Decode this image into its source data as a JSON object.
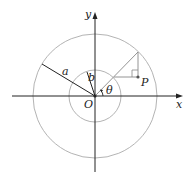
{
  "diagram": {
    "title": "",
    "labels": {
      "x_axis": "x",
      "y_axis": "y",
      "origin": "O",
      "outer_radius": "a",
      "inner_radius": "b",
      "angle": "θ",
      "point": "P"
    },
    "elements": {
      "outer_circle": {
        "center": [
          95,
          96
        ],
        "radius": 62,
        "color": "#aaaaaa"
      },
      "inner_circle": {
        "center": [
          95,
          96
        ],
        "radius": 26,
        "color": "#aaaaaa"
      },
      "axes_color": "#222222",
      "construction_line_color": "#888888"
    }
  }
}
